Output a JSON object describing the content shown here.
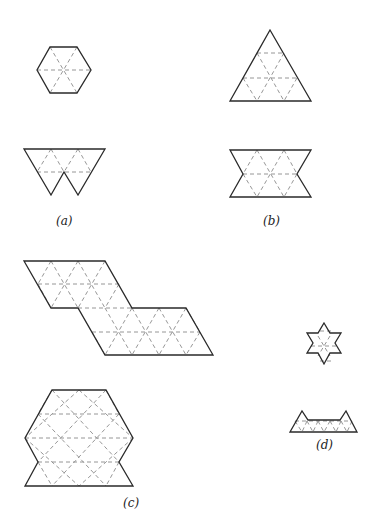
{
  "figure": {
    "colors": {
      "outline": "#2a2a2a",
      "grid_dashes": "#8a8a8a",
      "background": "#ffffff"
    }
  },
  "panels": [
    {
      "id": "a",
      "label": "(a)",
      "shapes": [
        "hexagon",
        "w-shape"
      ]
    },
    {
      "id": "b",
      "label": "(b)",
      "shapes": [
        "large-triangle",
        "hourglass"
      ]
    },
    {
      "id": "c",
      "label": "(c)",
      "shapes": [
        "stepped-parallelogram",
        "notched-hexagon"
      ]
    },
    {
      "id": "d",
      "label": "(d)",
      "shapes": [
        "star-of-david",
        "twin-peak"
      ]
    }
  ],
  "labels": {
    "a": "(a)",
    "b": "(b)",
    "c": "(c)",
    "d": "(d)"
  }
}
